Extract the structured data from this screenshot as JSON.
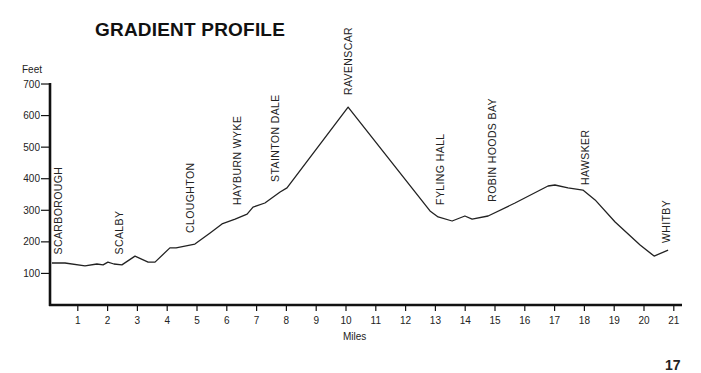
{
  "page": {
    "title": "GRADIENT PROFILE",
    "page_number": "17"
  },
  "chart_data": {
    "type": "line",
    "title": "GRADIENT PROFILE",
    "xlabel": "Miles",
    "ylabel": "Feet",
    "xlim": [
      0,
      21.3
    ],
    "ylim": [
      0,
      700
    ],
    "x_ticks": [
      1,
      2,
      3,
      4,
      5,
      6,
      7,
      8,
      9,
      10,
      11,
      12,
      13,
      14,
      15,
      16,
      17,
      18,
      19,
      20,
      21
    ],
    "y_ticks": [
      100,
      200,
      300,
      400,
      500,
      600,
      700
    ],
    "grid": false,
    "legend": null,
    "series": [
      {
        "name": "Elevation",
        "color": "#222222",
        "points": [
          [
            0.13,
            133
          ],
          [
            0.57,
            133
          ],
          [
            1.24,
            124
          ],
          [
            1.64,
            130
          ],
          [
            1.85,
            127
          ],
          [
            2.01,
            136
          ],
          [
            2.21,
            130
          ],
          [
            2.48,
            127
          ],
          [
            2.92,
            155
          ],
          [
            3.36,
            136
          ],
          [
            3.59,
            136
          ],
          [
            4.09,
            181
          ],
          [
            4.3,
            181
          ],
          [
            4.93,
            193
          ],
          [
            5.44,
            228
          ],
          [
            5.84,
            257
          ],
          [
            6.28,
            272
          ],
          [
            6.68,
            288
          ],
          [
            6.88,
            310
          ],
          [
            7.28,
            323
          ],
          [
            7.79,
            358
          ],
          [
            8.02,
            371
          ],
          [
            10.07,
            627
          ],
          [
            12.82,
            298
          ],
          [
            13.09,
            279
          ],
          [
            13.56,
            266
          ],
          [
            13.99,
            282
          ],
          [
            14.23,
            272
          ],
          [
            14.77,
            282
          ],
          [
            15.67,
            323
          ],
          [
            16.78,
            377
          ],
          [
            17.01,
            380
          ],
          [
            17.45,
            371
          ],
          [
            17.95,
            364
          ],
          [
            18.36,
            333
          ],
          [
            19.03,
            263
          ],
          [
            19.87,
            190
          ],
          [
            20.34,
            155
          ],
          [
            20.81,
            174
          ]
        ]
      }
    ],
    "annotations": [
      {
        "label": "SCARBOROUGH",
        "mile": 0.35,
        "label_bottom_ft": 160
      },
      {
        "label": "SCALBY",
        "mile": 2.38,
        "label_bottom_ft": 160
      },
      {
        "label": "CLOUGHTON",
        "mile": 4.76,
        "label_bottom_ft": 228
      },
      {
        "label": "HAYBURN WYKE",
        "mile": 6.34,
        "label_bottom_ft": 317
      },
      {
        "label": "STAINTON DALE",
        "mile": 7.62,
        "label_bottom_ft": 390
      },
      {
        "label": "RAVENSCAR",
        "mile": 10.07,
        "label_bottom_ft": 665
      },
      {
        "label": "FYLING HALL",
        "mile": 13.15,
        "label_bottom_ft": 317
      },
      {
        "label": "ROBIN HOODS BAY",
        "mile": 14.9,
        "label_bottom_ft": 327
      },
      {
        "label": "HAWSKER",
        "mile": 18.02,
        "label_bottom_ft": 380
      },
      {
        "label": "WHITBY",
        "mile": 20.74,
        "label_bottom_ft": 196
      }
    ]
  }
}
